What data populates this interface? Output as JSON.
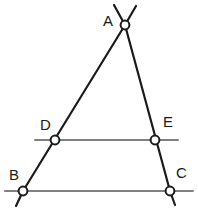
{
  "figure": {
    "type": "geometry-diagram",
    "width": 198,
    "height": 216,
    "background_color": "#ffffff",
    "stroke_colors": {
      "triangle_sides": "#1a1a1a",
      "horizontal_lines": "#808080",
      "node_outline": "#1a1a1a",
      "node_fill": "#ffffff"
    },
    "stroke_widths": {
      "triangle_sides": 2.2,
      "horizontal_lines": 2.0,
      "node_outline": 2.0
    }
  },
  "points": [
    {
      "id": "A",
      "label": "A",
      "cx": 125,
      "cy": 25,
      "r": 4.4,
      "label_x": 103,
      "label_y": 13
    },
    {
      "id": "D",
      "label": "D",
      "cx": 55,
      "cy": 140,
      "r": 4.4,
      "label_x": 40,
      "label_y": 117
    },
    {
      "id": "E",
      "label": "E",
      "cx": 155,
      "cy": 140,
      "r": 4.4,
      "label_x": 163,
      "label_y": 114
    },
    {
      "id": "B",
      "label": "B",
      "cx": 23,
      "cy": 191,
      "r": 4.4,
      "label_x": 9,
      "label_y": 167
    },
    {
      "id": "C",
      "label": "C",
      "cx": 170,
      "cy": 191,
      "r": 4.4,
      "label_x": 176,
      "label_y": 165
    }
  ],
  "segments": [
    {
      "id": "side-AB",
      "name": "triangle-side-ab",
      "from": "A",
      "to": "B",
      "x1": 125,
      "y1": 25,
      "x2": 23,
      "y2": 191,
      "style": "triangle_sides"
    },
    {
      "id": "side-AC",
      "name": "triangle-side-ac",
      "from": "A",
      "to": "C",
      "x1": 125,
      "y1": 25,
      "x2": 170,
      "y2": 191,
      "style": "triangle_sides"
    },
    {
      "id": "line-DE",
      "name": "midline-de",
      "from": "D",
      "to": "E",
      "x1": 35,
      "y1": 140,
      "x2": 178,
      "y2": 140,
      "style": "horizontal_lines"
    },
    {
      "id": "line-BC",
      "name": "baseline-bc",
      "from": "B",
      "to": "C",
      "x1": 5,
      "y1": 191,
      "x2": 193,
      "y2": 191,
      "style": "horizontal_lines"
    }
  ],
  "extensions": [
    {
      "id": "ext-A-left",
      "name": "ray-extension-above-a-left",
      "x1": 125,
      "y1": 25,
      "x2": 114,
      "y2": 5,
      "style": "triangle_sides"
    },
    {
      "id": "ext-A-right",
      "name": "ray-extension-above-a-right",
      "x1": 125,
      "y1": 25,
      "x2": 136,
      "y2": 6,
      "style": "triangle_sides"
    },
    {
      "id": "ext-B-down",
      "name": "ray-extension-below-b",
      "x1": 23,
      "y1": 191,
      "x2": 16,
      "y2": 206,
      "style": "triangle_sides"
    },
    {
      "id": "ext-C-down",
      "name": "ray-extension-below-c",
      "x1": 170,
      "y1": 191,
      "x2": 175,
      "y2": 205,
      "style": "triangle_sides"
    }
  ]
}
